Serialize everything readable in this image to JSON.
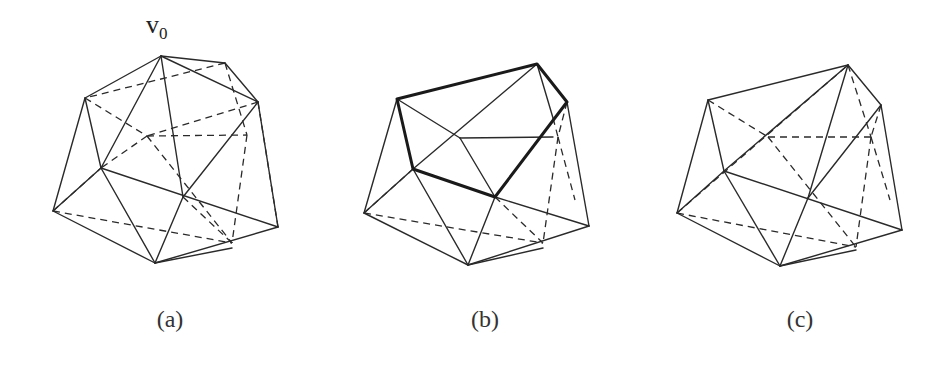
{
  "figure": {
    "panels": [
      {
        "id": "a",
        "caption": "(a)",
        "description": "Triangulated polyhedron with vertex v0 marked"
      },
      {
        "id": "b",
        "caption": "(b)",
        "description": "Polyhedron after removing v0; bold pentagon boundary retriangulated"
      },
      {
        "id": "c",
        "caption": "(c)",
        "description": "Retriangulated polyhedron"
      }
    ],
    "vertex_label": {
      "letter": "v",
      "subscript": "0"
    }
  },
  "colors": {
    "line": "#2a2a2a",
    "background": "#ffffff"
  }
}
